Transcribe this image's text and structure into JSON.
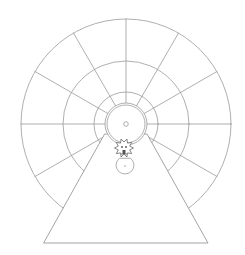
{
  "diagram": {
    "title": "Wheel line drawing",
    "stroke_color": "#9a9a9a",
    "dark_stroke_color": "#555555",
    "background": "#ffffff",
    "wheel": {
      "center": [
        126,
        124
      ],
      "rings": [
        {
          "name": "outer-rim",
          "radius": 105
        },
        {
          "name": "middle-ring",
          "radius": 63
        },
        {
          "name": "inner-ring",
          "radius": 32
        }
      ],
      "hub": {
        "outer_radius": 21,
        "inner_radius": 19,
        "axle_radius": 2.3
      },
      "spoke_count": 12,
      "spoke_angle_step_deg": 30
    },
    "stand": {
      "shape": "triangle",
      "apex_left": [
        105,
        134
      ],
      "apex_right": [
        147,
        134
      ],
      "base_left": [
        44,
        243
      ],
      "base_right": [
        208,
        243
      ]
    },
    "figure": {
      "description": "small spiky cat-like creature on a half-round bowl",
      "head_center": [
        124,
        148
      ],
      "head_radius": 6,
      "bowl_center": [
        125,
        165
      ],
      "bowl_radius": 9
    },
    "labels": {
      "wheel": "wheel",
      "stand": "stand",
      "figure": "figure"
    }
  }
}
